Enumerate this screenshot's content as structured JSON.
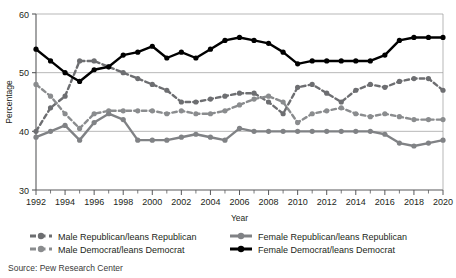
{
  "chart_data": {
    "type": "line",
    "title": "",
    "xlabel": "Year",
    "ylabel": "Percentage",
    "ylim": [
      30,
      60
    ],
    "xlim": [
      1992,
      2020
    ],
    "yticks": [
      30,
      40,
      50,
      60
    ],
    "xticks": [
      1992,
      1994,
      1996,
      1998,
      2000,
      2002,
      2004,
      2006,
      2008,
      2010,
      2012,
      2014,
      2016,
      2018,
      2020
    ],
    "x": [
      1992,
      1993,
      1994,
      1995,
      1996,
      1997,
      1998,
      1999,
      2000,
      2001,
      2002,
      2003,
      2004,
      2005,
      2006,
      2007,
      2008,
      2009,
      2010,
      2011,
      2012,
      2013,
      2014,
      2015,
      2016,
      2017,
      2018,
      2019,
      2020
    ],
    "grid": "horizontal",
    "legend_position": "bottom",
    "series": [
      {
        "name": "Male Republican/leans Republican",
        "key": "male_rep",
        "color": "#6d6e71",
        "style": "dashed",
        "values": [
          40.0,
          44.0,
          46.0,
          52.0,
          52.0,
          51.0,
          50.0,
          49.0,
          48.0,
          47.0,
          45.0,
          45.0,
          45.5,
          46.0,
          46.5,
          46.5,
          45.0,
          43.0,
          47.5,
          48.0,
          46.5,
          45.0,
          47.0,
          48.0,
          47.5,
          48.5,
          49.0,
          49.0,
          47.0
        ]
      },
      {
        "name": "Male Democrat/leans Democrat",
        "key": "male_dem",
        "color": "#8a8c8e",
        "style": "dashed",
        "values": [
          48.0,
          46.0,
          43.0,
          40.5,
          43.0,
          43.5,
          43.5,
          43.5,
          43.5,
          43.0,
          43.5,
          43.0,
          43.0,
          43.5,
          44.5,
          45.5,
          46.0,
          45.0,
          41.5,
          43.0,
          43.5,
          44.0,
          43.0,
          42.5,
          43.0,
          42.5,
          42.0,
          42.0,
          42.0
        ]
      },
      {
        "name": "Female Republican/leans Republican",
        "key": "female_rep",
        "color": "#808285",
        "style": "solid",
        "values": [
          39.0,
          40.0,
          41.0,
          38.5,
          41.5,
          43.0,
          42.0,
          38.5,
          38.5,
          38.5,
          39.0,
          39.5,
          39.0,
          38.5,
          40.5,
          40.0,
          40.0,
          40.0,
          40.0,
          40.0,
          40.0,
          40.0,
          40.0,
          40.0,
          39.5,
          38.0,
          37.5,
          38.0,
          38.5
        ]
      },
      {
        "name": "Female Democrat/leans Democrat",
        "key": "female_dem",
        "color": "#000000",
        "style": "solid",
        "values": [
          54.0,
          52.0,
          50.0,
          48.5,
          50.5,
          51.0,
          53.0,
          53.5,
          54.5,
          52.5,
          53.5,
          52.5,
          54.0,
          55.5,
          56.0,
          55.5,
          55.0,
          53.5,
          51.5,
          52.0,
          52.0,
          52.0,
          52.0,
          52.0,
          53.0,
          55.5,
          56.0,
          56.0,
          56.0
        ]
      }
    ]
  },
  "legend": {
    "items": [
      {
        "label": "Male Republican/leans Republican",
        "color": "#6d6e71",
        "style": "dashed"
      },
      {
        "label": "Male Democrat/leans Democrat",
        "color": "#8a8c8e",
        "style": "dashed"
      },
      {
        "label": "Female Republican/leans Republican",
        "color": "#808285",
        "style": "solid"
      },
      {
        "label": "Female Democrat/leans Democrat",
        "color": "#000000",
        "style": "solid"
      }
    ]
  },
  "source": {
    "text": "Source: Pew Research Center"
  }
}
